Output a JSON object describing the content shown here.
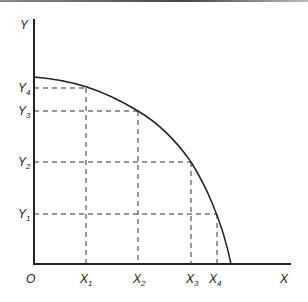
{
  "diagram": {
    "type": "production-possibility-frontier",
    "axes": {
      "x_label": "X",
      "y_label": "Y",
      "origin_label": "O"
    },
    "x_ticks": [
      {
        "base": "X",
        "sub": "1"
      },
      {
        "base": "X",
        "sub": "2"
      },
      {
        "base": "X",
        "sub": "3"
      },
      {
        "base": "X",
        "sub": "4"
      }
    ],
    "y_ticks": [
      {
        "base": "Y",
        "sub": "1"
      },
      {
        "base": "Y",
        "sub": "2"
      },
      {
        "base": "Y",
        "sub": "3"
      },
      {
        "base": "Y",
        "sub": "4"
      }
    ],
    "points": [
      {
        "x": "X1",
        "y": "Y4"
      },
      {
        "x": "X2",
        "y": "Y3"
      },
      {
        "x": "X3",
        "y": "Y2"
      },
      {
        "x": "X4",
        "y": "Y1"
      }
    ],
    "colors": {
      "line": "#222222",
      "background": "#ffffff"
    }
  }
}
